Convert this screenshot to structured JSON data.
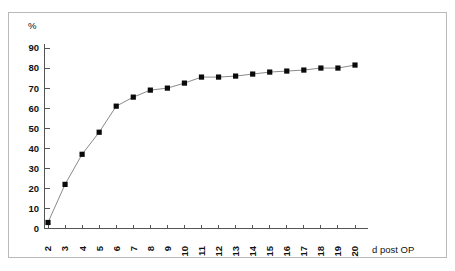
{
  "figure": {
    "unit_label": "%",
    "x_axis_title": "d post OP"
  },
  "chart_data": {
    "type": "line",
    "title": "",
    "subtitle": "",
    "xlabel": "d post OP",
    "ylabel": "%",
    "ylim": [
      0,
      90
    ],
    "xlim": [
      2,
      20
    ],
    "grid": false,
    "legend": "none",
    "marker": "filled-square",
    "line_color": "#8a8a8a",
    "marker_color": "#0a0a0a",
    "y_ticks": [
      0,
      10,
      20,
      30,
      40,
      50,
      60,
      70,
      80,
      90
    ],
    "y_tick_labels": [
      "0",
      "10",
      "20",
      "30",
      "40",
      "50",
      "60",
      "70",
      "80",
      "90"
    ],
    "x_ticks": [
      2,
      3,
      4,
      5,
      6,
      7,
      8,
      9,
      10,
      11,
      12,
      13,
      14,
      15,
      16,
      17,
      18,
      19,
      20
    ],
    "x_tick_labels": [
      "2",
      "3",
      "4",
      "5",
      "6",
      "7",
      "8",
      "9",
      "10",
      "11",
      "12",
      "13",
      "14",
      "15",
      "16",
      "17",
      "18",
      "19",
      "20"
    ],
    "x_tick_label_rotation": -90,
    "categories": [
      2,
      3,
      4,
      5,
      6,
      7,
      8,
      9,
      10,
      11,
      12,
      13,
      14,
      15,
      16,
      17,
      18,
      19,
      20
    ],
    "values": [
      3,
      22,
      37,
      48,
      61,
      65.5,
      69,
      70,
      72.5,
      75.5,
      75.5,
      76,
      77,
      78,
      78.5,
      79,
      80,
      80,
      81.5
    ],
    "series": [
      {
        "name": "cumulative percentage",
        "values": [
          3,
          22,
          37,
          48,
          61,
          65.5,
          69,
          70,
          72.5,
          75.5,
          75.5,
          76,
          77,
          78,
          78.5,
          79,
          80,
          80,
          81.5
        ]
      }
    ]
  }
}
